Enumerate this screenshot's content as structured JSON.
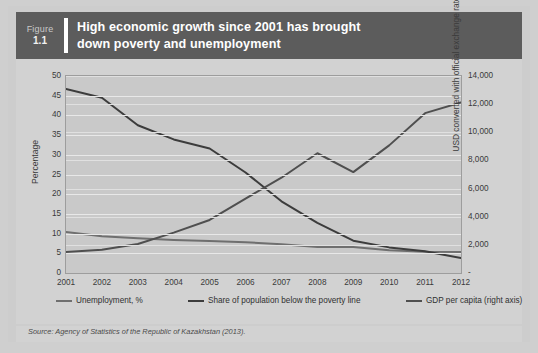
{
  "figure": {
    "label": "Figure",
    "number": "1.1",
    "title": "High economic growth since 2001 has brought\ndown poverty and unemployment"
  },
  "source": {
    "prefix": "Source:",
    "text": "Source: Agency of Statistics of the Republic of Kazakhstan (2013)."
  },
  "colors": {
    "header_bg": "#5c5c5c",
    "card_bg": "#cdcdcd",
    "plot_bg": "#c9c9c9",
    "grid": "#e8e8e8",
    "axis": "#9d9d9d",
    "series_unemployment": "#6f6f6f",
    "series_poverty": "#3c3c3c",
    "series_gdp": "#4f4f4f"
  },
  "chart_data": {
    "type": "line",
    "title": "High economic growth since 2001 has brought down poverty and unemployment",
    "xlabel": "",
    "ylabel": "Percentage",
    "y2label": "USD converted with official exchange rate",
    "grid": true,
    "legend_position": "bottom",
    "categories": [
      "2001",
      "2002",
      "2003",
      "2004",
      "2005",
      "2006",
      "2007",
      "2008",
      "2009",
      "2010",
      "2011",
      "2012"
    ],
    "ylim": [
      0,
      50
    ],
    "yticks": [
      0,
      5,
      10,
      15,
      20,
      25,
      30,
      35,
      40,
      45,
      50
    ],
    "yticklabels": [
      "0",
      "5",
      "10",
      "15",
      "20",
      "25",
      "30",
      "35",
      "40",
      "45",
      "50"
    ],
    "y2lim": [
      0,
      14000
    ],
    "y2ticks": [
      0,
      2000,
      4000,
      6000,
      8000,
      10000,
      12000,
      14000
    ],
    "y2ticklabels": [
      "-",
      "2,000",
      "4,000",
      "6,000",
      "8,000",
      "10,000",
      "12,000",
      "14,000"
    ],
    "series": [
      {
        "name": "Unemployment, %",
        "axis": "left",
        "values": [
          10.4,
          9.3,
          8.8,
          8.4,
          8.1,
          7.8,
          7.3,
          6.6,
          6.6,
          5.8,
          5.4,
          5.3
        ]
      },
      {
        "name": "Share of population below the poverty line",
        "axis": "left",
        "values": [
          46.7,
          44.5,
          37.5,
          33.9,
          31.6,
          25.5,
          18.2,
          12.7,
          8.2,
          6.5,
          5.5,
          3.8
        ]
      },
      {
        "name": "GDP per capita (right axis)",
        "axis": "right",
        "values": [
          1490,
          1660,
          2060,
          2870,
          3770,
          5290,
          6770,
          8510,
          7170,
          9070,
          11360,
          12120
        ]
      }
    ]
  }
}
